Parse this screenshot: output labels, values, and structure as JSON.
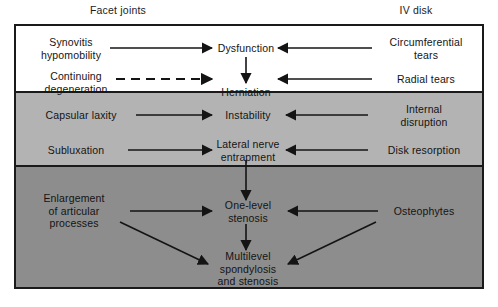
{
  "figure": {
    "type": "flow-diagram",
    "headers": {
      "left": "Facet joints",
      "right": "IV disk"
    },
    "bands": [
      {
        "name": "dysfunction-stage",
        "fill": "#ffffff"
      },
      {
        "name": "instability-stage",
        "fill": "#b3b3b3"
      },
      {
        "name": "stabilization-stage",
        "fill": "#8d8d8d"
      }
    ],
    "nodes": {
      "synovitis": "Synovitis\nhypomobility",
      "dysfunction": "Dysfunction",
      "circumferential_tears": "Circumferential\ntears",
      "continuing_degeneration": "Continuing\ndegeneration",
      "herniation": "Herniation",
      "radial_tears": "Radial tears",
      "capsular_laxity": "Capsular laxity",
      "instability": "Instability",
      "internal_disruption": "Internal\ndisruption",
      "subluxation": "Subluxation",
      "lateral_nerve_entrapment": "Lateral nerve\nentrapment",
      "disk_resorption": "Disk resorption",
      "enlargement": "Enlargement\nof articular\nprocesses",
      "one_level_stenosis": "One-level\nstenosis",
      "osteophytes": "Osteophytes",
      "multilevel": "Multilevel\nspondylosis\nand stenosis"
    },
    "colors": {
      "ink": "#141414",
      "border": "#1a1a1a",
      "band_top": "#ffffff",
      "band_middle": "#b3b3b3",
      "band_bottom": "#8d8d8d"
    }
  }
}
